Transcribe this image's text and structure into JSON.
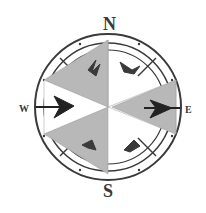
{
  "compass": {
    "labels": {
      "north": "N",
      "south": "S",
      "east": "E",
      "west": "W"
    },
    "colors": {
      "ink": "#333333",
      "star_fill": "#b8b8b8",
      "background": "#ffffff"
    },
    "icons": {
      "rose": "compass-rose-icon",
      "ornaments": "leaf-ornament-icon"
    }
  }
}
